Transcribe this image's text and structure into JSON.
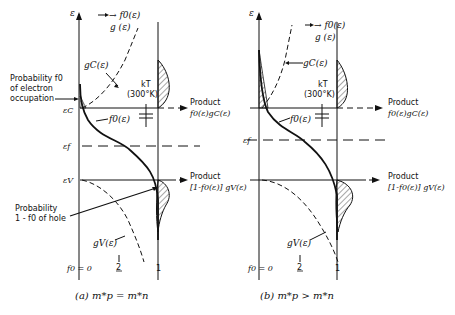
{
  "panel_a": {
    "caption": "(a)  m*p = m*n",
    "axis_label": "ε",
    "f_g_label_1": "→ f0(ε)",
    "f_g_label_2": "g (ε)",
    "gc_label": "gC(ε)",
    "prob_electron_1": "Probability  f0",
    "prob_electron_2": "of electron",
    "prob_electron_3": "occupation",
    "ec_label": "εC",
    "ef_label": "εf",
    "ev_label": "εV",
    "f0_curve_label": "f0(ε)",
    "kt_label_1": "kT",
    "kt_label_2": "(300°K)",
    "product_c_1": "Product",
    "product_c_2": "f0(ε)gC(ε)",
    "product_v_1": "Product",
    "product_v_2": "[1-f0(ε)] gV(ε)",
    "prob_hole_1": "Probability",
    "prob_hole_2": "1 - f0  of hole",
    "gv_label": "gV(ε)",
    "tick_0": "f0 = 0",
    "tick_half_num": "1",
    "tick_half_den": "2",
    "tick_1": "1"
  },
  "panel_b": {
    "caption": "(b)  m*p > m*n",
    "axis_label": "ε",
    "f_g_label_1": "→ f0(ε)",
    "f_g_label_2": "g (ε)",
    "gc_label": "gC(ε)",
    "ef_label": "εf",
    "f0_curve_label": "f0(ε)",
    "kt_label_1": "kT",
    "kt_label_2": "(300°K)",
    "product_c_1": "Product",
    "product_c_2": "f0(ε)gC(ε)",
    "product_v_1": "Product",
    "product_v_2": "[1-f0(ε)] gV(ε)",
    "gv_label": "gV(ε)",
    "tick_0": "f0 = 0",
    "tick_half_num": "1",
    "tick_half_den": "2",
    "tick_1": "1"
  }
}
